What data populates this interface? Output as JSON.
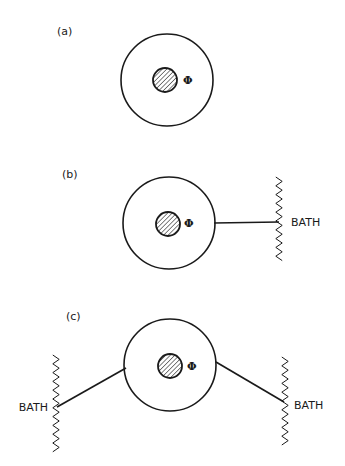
{
  "diagram": {
    "colors": {
      "ink": "#1a1a1a",
      "background": "#ffffff"
    },
    "panels": [
      {
        "id": "a",
        "label": "(a)",
        "label_pos": [
          57,
          35
        ],
        "outer_circle": {
          "cx": 167,
          "cy": 80,
          "r": 46
        },
        "core": {
          "cx": 165,
          "cy": 80,
          "r": 12,
          "fill": "hatched"
        },
        "phi": {
          "text": "Φ",
          "x": 183,
          "y": 84
        },
        "baths": []
      },
      {
        "id": "b",
        "label": "(b)",
        "label_pos": [
          62,
          178
        ],
        "outer_circle": {
          "cx": 169,
          "cy": 223,
          "r": 46
        },
        "core": {
          "cx": 168,
          "cy": 224,
          "r": 12,
          "fill": "hatched"
        },
        "phi": {
          "text": "Φ",
          "x": 184,
          "y": 227
        },
        "baths": [
          {
            "label": "BATH",
            "line": {
              "x1": 214,
              "y1": 223,
              "x2": 279,
              "y2": 222
            },
            "wall": {
              "x": 279,
              "y_top": 177,
              "y_bottom": 265
            },
            "label_pos": [
              291,
              226
            ],
            "label_anchor": "start"
          }
        ]
      },
      {
        "id": "c",
        "label": "(c)",
        "label_pos": [
          66,
          320
        ],
        "outer_circle": {
          "cx": 170,
          "cy": 365,
          "r": 46
        },
        "core": {
          "cx": 170,
          "cy": 366,
          "r": 12,
          "fill": "hatched"
        },
        "phi": {
          "text": "Φ",
          "x": 187,
          "y": 370
        },
        "baths": [
          {
            "label": "BATH",
            "line": {
              "x1": 126,
              "y1": 368,
              "x2": 57,
              "y2": 407
            },
            "wall": {
              "x": 56,
              "y_top": 355,
              "y_bottom": 455
            },
            "label_pos": [
              48,
              411
            ],
            "label_anchor": "end"
          },
          {
            "label": "BATH",
            "line": {
              "x1": 216,
              "y1": 362,
              "x2": 284,
              "y2": 402
            },
            "wall": {
              "x": 285,
              "y_top": 357,
              "y_bottom": 445
            },
            "label_pos": [
              294,
              409
            ],
            "label_anchor": "start"
          }
        ]
      }
    ]
  }
}
